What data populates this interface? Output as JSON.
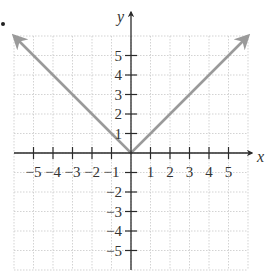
{
  "chart_data": {
    "type": "line",
    "title": "",
    "function": "y = |x|",
    "xlabel": "x",
    "ylabel": "y",
    "xlim": [
      -6,
      6
    ],
    "ylim": [
      -6,
      6
    ],
    "grid": true,
    "legend": null,
    "x_ticks": [
      -5,
      -4,
      -3,
      -2,
      -1,
      1,
      2,
      3,
      4,
      5
    ],
    "y_ticks": [
      -5,
      -4,
      -3,
      -2,
      -1,
      1,
      2,
      3,
      4,
      5
    ],
    "x_tick_labels": [
      "−5",
      "−4",
      "−3",
      "−2",
      "−1",
      "1",
      "2",
      "3",
      "4",
      "5"
    ],
    "y_tick_labels": [
      "−5",
      "−4",
      "−3",
      "−2",
      "−1",
      "1",
      "2",
      "3",
      "4",
      "5"
    ],
    "series": [
      {
        "name": "y = |x|",
        "x": [
          -6,
          -5,
          -4,
          -3,
          -2,
          -1,
          0,
          1,
          2,
          3,
          4,
          5,
          6
        ],
        "y": [
          6,
          5,
          4,
          3,
          2,
          1,
          0,
          1,
          2,
          3,
          4,
          5,
          6
        ],
        "arrows_at_ends": true,
        "color": "#9a9a9a"
      }
    ],
    "colors": {
      "grid": "#c8c8c8",
      "axis": "#2a2a2a",
      "line": "#9a9a9a",
      "text": "#333333"
    }
  },
  "labels": {
    "x_axis": "x",
    "y_axis": "y"
  }
}
